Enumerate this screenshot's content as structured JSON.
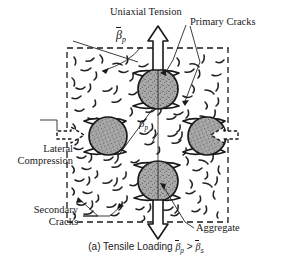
{
  "figure": {
    "caption_prefix": "(a) Tensile Loading",
    "caption_relation": ">",
    "labels": {
      "uniaxial_tension": "Uniaxial Tension",
      "primary_cracks": "Primary Cracks",
      "lateral_compression_line1": "Lateral",
      "lateral_compression_line2": "Compression",
      "secondary_cracks_line1": "Secondary",
      "secondary_cracks_line2": "Cracks",
      "aggregate": "Aggregate"
    },
    "symbols": {
      "beta_bar_p": "β",
      "beta_bar_p_sub": "p",
      "beta_bar_s_sub": "s",
      "beta_angle": "β",
      "beta_angle_sub": "p"
    },
    "colors": {
      "ink": "#1a1a1a",
      "aggregate_fill": "#a8a8a8",
      "aggregate_stroke": "#1a1a1a",
      "background": "#ffffff",
      "crack_stroke": "#222222"
    },
    "specimen": {
      "boundary_style": "dashed",
      "box": {
        "x": 67,
        "y": 48,
        "width": 161,
        "height": 174
      }
    },
    "aggregates": [
      {
        "name": "aggregate-top",
        "cx": 158,
        "cy": 89,
        "r": 20
      },
      {
        "name": "aggregate-left",
        "cx": 108,
        "cy": 136,
        "r": 19
      },
      {
        "name": "aggregate-right",
        "cx": 207,
        "cy": 136,
        "r": 19
      },
      {
        "name": "aggregate-bottom",
        "cx": 158,
        "cy": 181,
        "r": 20
      }
    ],
    "load_arrows": [
      {
        "name": "tension-arrow-top",
        "direction": "up"
      },
      {
        "name": "tension-arrow-bottom",
        "direction": "down"
      },
      {
        "name": "compression-arrow-left",
        "direction": "right"
      },
      {
        "name": "compression-arrow-right",
        "direction": "left"
      }
    ]
  }
}
